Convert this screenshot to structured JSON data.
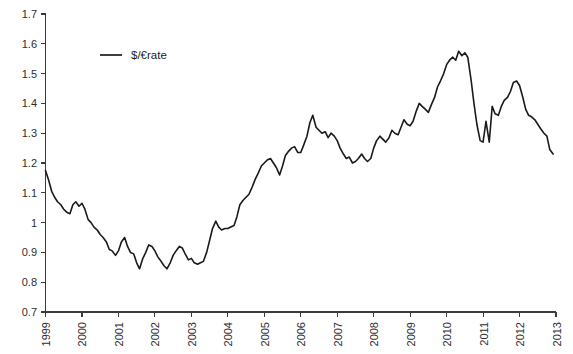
{
  "chart_data": {
    "type": "line",
    "title": "",
    "subtitle": "",
    "xlabel": "",
    "ylabel": "",
    "xlim": [
      1999.0,
      2013.0
    ],
    "ylim": [
      0.7,
      1.7
    ],
    "grid": false,
    "legend_position": "top-left-inside",
    "y_ticks": [
      "0.7",
      "0.8",
      "0.9",
      "1",
      "1.1",
      "1.2",
      "1.3",
      "1.4",
      "1.5",
      "1.6",
      "1.7"
    ],
    "y_tick_values": [
      0.7,
      0.8,
      0.9,
      1.0,
      1.1,
      1.2,
      1.3,
      1.4,
      1.5,
      1.6,
      1.7
    ],
    "x_ticks": [
      "1999",
      "2000",
      "2001",
      "2002",
      "2003",
      "2004",
      "2005",
      "2006",
      "2007",
      "2008",
      "2009",
      "2010",
      "2011",
      "2012",
      "2013"
    ],
    "x_tick_values": [
      1999,
      2000,
      2001,
      2002,
      2003,
      2004,
      2005,
      2006,
      2007,
      2008,
      2009,
      2010,
      2011,
      2012,
      2013
    ],
    "series": [
      {
        "name": "$/€rate",
        "color": "#1a1a1a",
        "x": [
          1999.0,
          1999.08,
          1999.17,
          1999.25,
          1999.33,
          1999.42,
          1999.5,
          1999.58,
          1999.67,
          1999.75,
          1999.83,
          1999.92,
          2000.0,
          2000.08,
          2000.17,
          2000.25,
          2000.33,
          2000.42,
          2000.5,
          2000.58,
          2000.67,
          2000.75,
          2000.83,
          2000.92,
          2001.0,
          2001.08,
          2001.17,
          2001.25,
          2001.33,
          2001.42,
          2001.5,
          2001.58,
          2001.67,
          2001.75,
          2001.83,
          2001.92,
          2002.0,
          2002.08,
          2002.17,
          2002.25,
          2002.33,
          2002.42,
          2002.5,
          2002.58,
          2002.67,
          2002.75,
          2002.83,
          2002.92,
          2003.0,
          2003.08,
          2003.17,
          2003.25,
          2003.33,
          2003.42,
          2003.5,
          2003.58,
          2003.67,
          2003.75,
          2003.83,
          2003.92,
          2004.0,
          2004.08,
          2004.17,
          2004.25,
          2004.33,
          2004.42,
          2004.5,
          2004.58,
          2004.67,
          2004.75,
          2004.83,
          2004.92,
          2005.0,
          2005.08,
          2005.17,
          2005.25,
          2005.33,
          2005.42,
          2005.5,
          2005.58,
          2005.67,
          2005.75,
          2005.83,
          2005.92,
          2006.0,
          2006.08,
          2006.17,
          2006.25,
          2006.33,
          2006.42,
          2006.5,
          2006.58,
          2006.67,
          2006.75,
          2006.83,
          2006.92,
          2007.0,
          2007.08,
          2007.17,
          2007.25,
          2007.33,
          2007.42,
          2007.5,
          2007.58,
          2007.67,
          2007.75,
          2007.83,
          2007.92,
          2008.0,
          2008.08,
          2008.17,
          2008.25,
          2008.33,
          2008.42,
          2008.5,
          2008.58,
          2008.67,
          2008.75,
          2008.83,
          2008.92,
          2009.0,
          2009.08,
          2009.17,
          2009.25,
          2009.33,
          2009.42,
          2009.5,
          2009.58,
          2009.67,
          2009.75,
          2009.83,
          2009.92,
          2010.0,
          2010.08,
          2010.17,
          2010.25,
          2010.33,
          2010.42,
          2010.5,
          2010.58,
          2010.67,
          2010.75,
          2010.83,
          2010.92,
          2011.0,
          2011.08,
          2011.17,
          2011.25,
          2011.33,
          2011.42,
          2011.5,
          2011.58,
          2011.67,
          2011.75,
          2011.83,
          2011.92,
          2012.0,
          2012.08,
          2012.17,
          2012.25,
          2012.33,
          2012.42,
          2012.5,
          2012.58,
          2012.67,
          2012.75,
          2012.83,
          2012.92
        ],
        "values": [
          1.175,
          1.145,
          1.105,
          1.085,
          1.07,
          1.06,
          1.045,
          1.035,
          1.03,
          1.06,
          1.07,
          1.055,
          1.065,
          1.045,
          1.01,
          1.0,
          0.985,
          0.975,
          0.96,
          0.95,
          0.935,
          0.91,
          0.905,
          0.89,
          0.905,
          0.935,
          0.95,
          0.92,
          0.9,
          0.895,
          0.865,
          0.845,
          0.88,
          0.9,
          0.925,
          0.92,
          0.905,
          0.885,
          0.87,
          0.855,
          0.845,
          0.865,
          0.89,
          0.905,
          0.92,
          0.915,
          0.895,
          0.875,
          0.88,
          0.865,
          0.86,
          0.865,
          0.87,
          0.9,
          0.94,
          0.98,
          1.005,
          0.985,
          0.975,
          0.98,
          0.98,
          0.985,
          0.99,
          1.02,
          1.06,
          1.075,
          1.085,
          1.095,
          1.12,
          1.145,
          1.165,
          1.19,
          1.2,
          1.21,
          1.215,
          1.2,
          1.185,
          1.16,
          1.19,
          1.225,
          1.24,
          1.25,
          1.255,
          1.235,
          1.235,
          1.26,
          1.29,
          1.335,
          1.36,
          1.32,
          1.31,
          1.3,
          1.305,
          1.285,
          1.3,
          1.29,
          1.275,
          1.25,
          1.23,
          1.215,
          1.22,
          1.2,
          1.205,
          1.215,
          1.23,
          1.215,
          1.205,
          1.215,
          1.25,
          1.275,
          1.29,
          1.28,
          1.27,
          1.285,
          1.31,
          1.3,
          1.295,
          1.32,
          1.345,
          1.33,
          1.325,
          1.34,
          1.375,
          1.4,
          1.39,
          1.38,
          1.37,
          1.395,
          1.42,
          1.455,
          1.475,
          1.5,
          1.53,
          1.545,
          1.555,
          1.545,
          1.575,
          1.56,
          1.57,
          1.555,
          1.48,
          1.4,
          1.33,
          1.275,
          1.27,
          1.34,
          1.27,
          1.39,
          1.365,
          1.36,
          1.39,
          1.41,
          1.42,
          1.44,
          1.47,
          1.475,
          1.46,
          1.425,
          1.38,
          1.36,
          1.355,
          1.345,
          1.33,
          1.315,
          1.3,
          1.29,
          1.245,
          1.23
        ]
      }
    ],
    "annotations": []
  },
  "legend": {
    "entries": [
      {
        "label": "$/€rate",
        "color": "#1a1a1a"
      }
    ]
  },
  "axes": {
    "y_axis_name": "y-axis",
    "x_axis_name": "x-axis"
  }
}
